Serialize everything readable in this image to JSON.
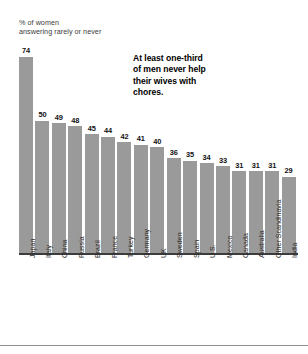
{
  "chart_data": {
    "type": "bar",
    "title": "",
    "subtitle": "% of women\nanswering rarely or never",
    "annotation": "At least one-third of men never help their wives with chores.",
    "xlabel": "",
    "ylabel": "% of women answering rarely or never",
    "ylim": [
      0,
      78
    ],
    "grid": false,
    "legend": false,
    "bar_color": "#9a9a9a",
    "categories": [
      "Japan",
      "Italy",
      "China",
      "Russia",
      "Brazil",
      "France",
      "Turkey",
      "Germany",
      "UK",
      "Sweden",
      "Spain",
      "U.S.",
      "Mexico",
      "Canada",
      "Australia",
      "Other Scandinavia",
      "India"
    ],
    "values": [
      74,
      50,
      49,
      48,
      45,
      44,
      42,
      41,
      40,
      36,
      35,
      34,
      33,
      31,
      31,
      31,
      29
    ]
  }
}
